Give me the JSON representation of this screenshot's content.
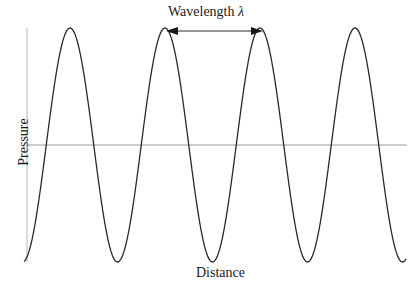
{
  "diagram": {
    "title": "Wavelength",
    "title_symbol": "λ",
    "x_axis_label": "Distance",
    "y_axis_label": "Pressure",
    "colors": {
      "curve": "#2a2a2a",
      "axis": "#9a9a9a",
      "text": "#1a1a1a"
    }
  },
  "chart_data": {
    "type": "line",
    "title": "Wavelength λ",
    "xlabel": "Distance",
    "ylabel": "Pressure",
    "function": "pressure = cos(2π·distance/λ)",
    "cycles_shown": 4,
    "crests_x_px": [
      70,
      166,
      263,
      355
    ],
    "troughs_x_px": [
      117,
      212,
      307,
      404
    ],
    "baseline_y_px": 145,
    "amplitude_px": 117,
    "wavelength_arrow": {
      "from_crest": 2,
      "to_crest": 3,
      "label": "Wavelength λ"
    },
    "grid": false
  }
}
